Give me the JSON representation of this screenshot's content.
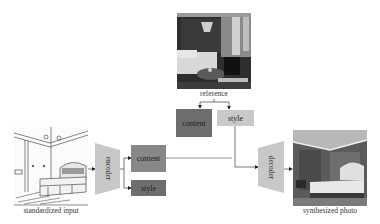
{
  "diagram": {
    "reference": {
      "label": "reference",
      "content_label": "content",
      "style_label": "style"
    },
    "input": {
      "label": "standardized input"
    },
    "encoder": {
      "label": "encoder",
      "content_label": "content",
      "style_label": "style"
    },
    "decoder": {
      "label": "decoder"
    },
    "output": {
      "label": "synthesized photo"
    },
    "colors": {
      "dark_box": "#6e6e6e",
      "mid_box": "#888888",
      "light_box": "#c9c9c9",
      "trapezoid": "#c8c8c8",
      "line": "#555555"
    }
  }
}
